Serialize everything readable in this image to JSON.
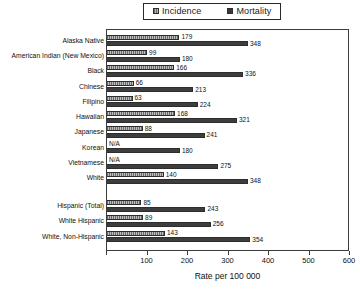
{
  "chart_data": {
    "type": "bar",
    "orientation": "horizontal",
    "title": "",
    "xlabel": "Rate per 100 000",
    "ylabel": "",
    "xlim": [
      0,
      600
    ],
    "xticks": [
      0,
      100,
      200,
      300,
      400,
      500,
      600
    ],
    "grid": false,
    "legend_position": "top",
    "categories": [
      "Alaska Native",
      "American Indian (New Mexico)",
      "Black",
      "Chinese",
      "Filipino",
      "Hawaiian",
      "Japanese",
      "Korean",
      "Vietnamese",
      "White",
      "Hispanic (Total)",
      "White Hispanic",
      "White, Non-Hispanic"
    ],
    "series": [
      {
        "name": "Incidence",
        "color": "#9a9a9a",
        "values": [
          179,
          99,
          166,
          66,
          63,
          168,
          88,
          null,
          null,
          140,
          85,
          89,
          143
        ],
        "labels": [
          "179",
          "99",
          "166",
          "66",
          "63",
          "168",
          "88",
          "N/A",
          "N/A",
          "140",
          "85",
          "89",
          "143"
        ]
      },
      {
        "name": "Mortality",
        "color": "#3d3d3d",
        "values": [
          348,
          180,
          336,
          213,
          224,
          321,
          241,
          180,
          275,
          348,
          243,
          256,
          354
        ],
        "labels": [
          "348",
          "180",
          "336",
          "213",
          "224",
          "321",
          "241",
          "180",
          "275",
          "348",
          "243",
          "256",
          "354"
        ]
      }
    ]
  },
  "legend": {
    "incidence_label": "Incidence",
    "mortality_label": "Mortality"
  },
  "axis": {
    "title": "Rate per 100 000",
    "tick_labels": [
      "0",
      "100",
      "200",
      "300",
      "400",
      "500",
      "600"
    ]
  }
}
